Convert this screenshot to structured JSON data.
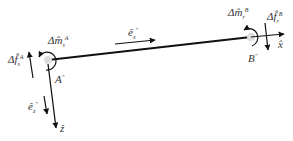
{
  "diagram": {
    "type": "beam element force diagram",
    "nodes": {
      "start": {
        "label": "A",
        "superscript": "\"",
        "x": 48,
        "y": 60
      },
      "end": {
        "label": "B",
        "superscript": "\"",
        "x": 251,
        "y": 37
      }
    },
    "labels": {
      "moment_a": {
        "base": "Δm̂",
        "sub": "s",
        "sup": "A"
      },
      "force_a": {
        "base": "Δf̂",
        "sub": "s",
        "sup": "A"
      },
      "moment_b": {
        "base": "Δm̂",
        "sub": "r",
        "sup": "B"
      },
      "force_b": {
        "base": "Δf̂",
        "sub": "r",
        "sup": "B"
      },
      "e_x": {
        "base": "ê",
        "sub": "x",
        "sup": "\""
      },
      "e_z": {
        "base": "ê",
        "sub": "z",
        "sup": "\""
      },
      "axis_x": "x̂",
      "axis_z": "ẑ"
    },
    "colors": {
      "line": "#111111",
      "text": "#333333",
      "node": "#dddddd"
    }
  }
}
